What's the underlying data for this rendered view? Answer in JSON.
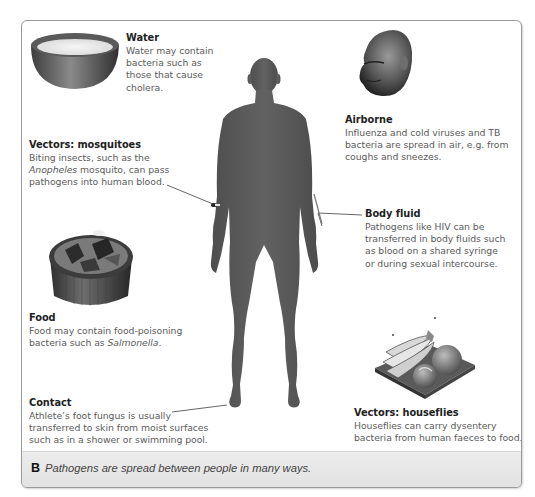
{
  "figure": {
    "caption_letter": "B",
    "caption_text": "Pathogens are spread between people in many ways.",
    "colors": {
      "frame_border": "#9a9a9a",
      "caption_bg": "#e6e6e6",
      "silhouette": "#5a5a5a",
      "title_text": "#222222",
      "body_text": "#5b5b5b"
    }
  },
  "callouts": {
    "water": {
      "title": "Water",
      "lines": [
        "Water may contain",
        "bacteria such as",
        "those that cause",
        "cholera."
      ],
      "icon": "bowl-of-water"
    },
    "airborne": {
      "title": "Airborne",
      "lines": [
        "Influenza and cold viruses and TB",
        "bacteria are spread in air, e.g. from",
        "coughs and sneezes."
      ],
      "icon": "sneezing-head"
    },
    "mosquitoes": {
      "title": "Vectors: mosquitoes",
      "line1": "Biting insects, such as the",
      "line2_italic": "Anopheles",
      "line2_rest": " mosquito, can pass",
      "line3": "pathogens into human blood.",
      "icon": "mosquito-on-arm"
    },
    "body_fluid": {
      "title": "Body fluid",
      "lines": [
        "Pathogens like HIV can be",
        "transferred in body fluids such",
        "as blood on a shared syringe",
        "or during sexual intercourse."
      ],
      "icon": "syringe-in-arm"
    },
    "food": {
      "title": "Food",
      "line1": "Food may contain food-poisoning",
      "line2_prefix": "bacteria such as ",
      "line2_italic": "Salmonella",
      "line2_suffix": ".",
      "icon": "food-container"
    },
    "contact": {
      "title": "Contact",
      "lines": [
        "Athlete’s foot fungus is usually",
        "transferred to skin from moist surfaces",
        "such as in a shower or swimming pool."
      ],
      "icon": "foot"
    },
    "houseflies": {
      "title": "Vectors: houseflies",
      "lines": [
        "Houseflies can carry dysentery",
        "bacteria from human faeces to food."
      ],
      "icon": "fruit-plate-with-flies"
    }
  }
}
